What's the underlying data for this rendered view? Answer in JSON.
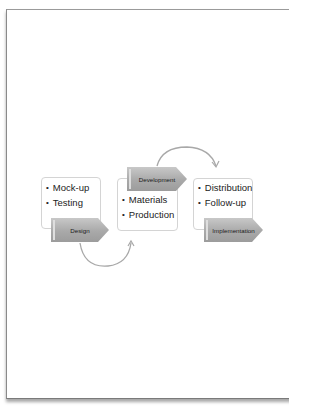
{
  "diagram": {
    "type": "process-cycle",
    "stages": [
      {
        "label": "Design",
        "bullets": [
          "Mock-up",
          "Testing"
        ]
      },
      {
        "label": "Development",
        "bullets": [
          "Materials",
          "Production"
        ]
      },
      {
        "label": "Implementation",
        "bullets": [
          "Distribution",
          "Follow-up"
        ]
      }
    ],
    "connectors": [
      {
        "from": "Design",
        "to": "Development",
        "style": "curved-arrow-below"
      },
      {
        "from": "Development",
        "to": "Implementation",
        "style": "curved-arrow-above"
      }
    ],
    "colors": {
      "chevron_fill": "#a9a9a9",
      "box_border": "#d4d4d4",
      "connector": "#a0a0a0"
    }
  }
}
